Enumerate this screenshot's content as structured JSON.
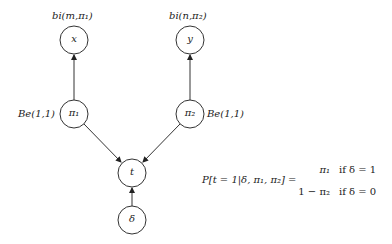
{
  "diagram": {
    "type": "bayesian-network",
    "nodes": [
      {
        "id": "x",
        "label": "x",
        "cx": 74,
        "cy": 40,
        "annotation": "bi(m,π₁)"
      },
      {
        "id": "y",
        "label": "y",
        "cx": 190,
        "cy": 40,
        "annotation": "bi(n,π₂)"
      },
      {
        "id": "pi1",
        "label": "π₁",
        "cx": 74,
        "cy": 114,
        "annotation": "Be(1,1)"
      },
      {
        "id": "pi2",
        "label": "π₂",
        "cx": 190,
        "cy": 114,
        "annotation": "Be(1,1)"
      },
      {
        "id": "t",
        "label": "t",
        "cx": 132,
        "cy": 173,
        "annotation": ""
      },
      {
        "id": "delta",
        "label": "δ",
        "cx": 132,
        "cy": 220,
        "annotation": ""
      }
    ],
    "edges": [
      {
        "from": "pi1",
        "to": "x"
      },
      {
        "from": "pi2",
        "to": "y"
      },
      {
        "from": "pi1",
        "to": "t"
      },
      {
        "from": "pi2",
        "to": "t"
      },
      {
        "from": "delta",
        "to": "t"
      }
    ],
    "equation": {
      "lhs": "P[t = 1|δ, π₁, π₂] =",
      "cases": [
        {
          "value": "π₁",
          "condition": "if δ = 1"
        },
        {
          "value": "1 − π₂",
          "condition": "if δ = 0"
        }
      ]
    }
  }
}
